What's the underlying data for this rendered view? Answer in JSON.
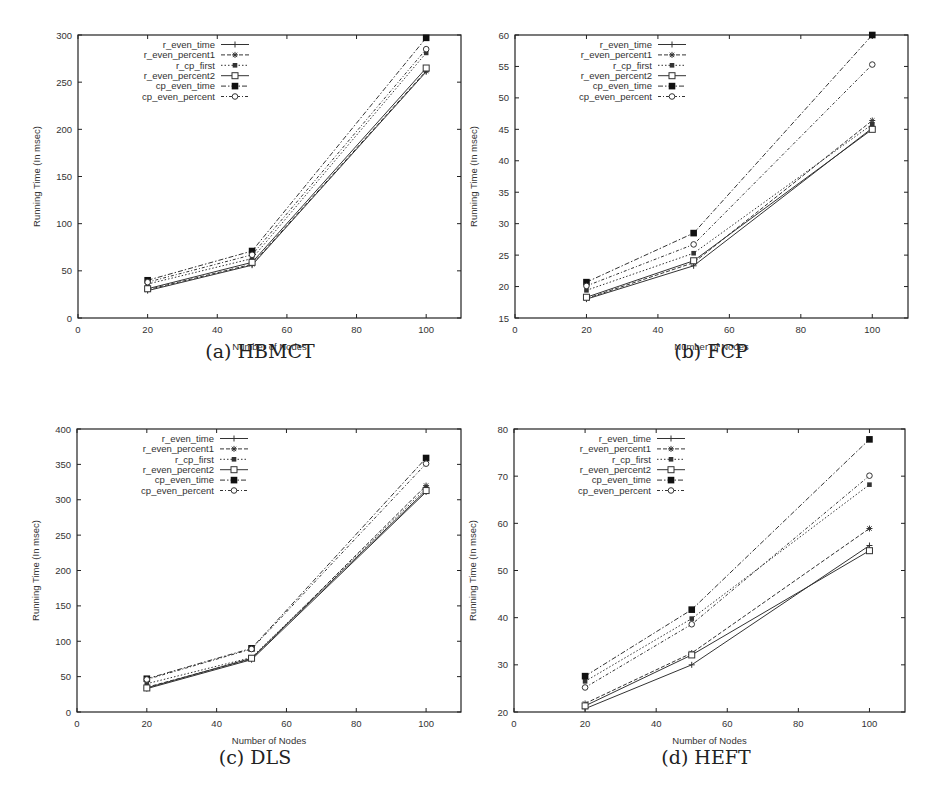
{
  "figure": {
    "series_names": [
      "r_even_time",
      "r_even_percent1",
      "r_cp_first",
      "r_even_percent2",
      "cp_even_time",
      "cp_even_percent"
    ],
    "xlabel": "Number of Nodes",
    "ylabel": "Running Time (In msec)"
  },
  "chart_data": [
    {
      "id": "a",
      "type": "line",
      "title": "(a) HBMCT",
      "xlabel": "Number of Nodes",
      "ylabel": "Running Time (In msec)",
      "x": [
        20,
        50,
        100
      ],
      "xlim": [
        0,
        110
      ],
      "ylim": [
        0,
        300
      ],
      "xticks": [
        0,
        20,
        40,
        60,
        80,
        100
      ],
      "yticks": [
        0,
        50,
        100,
        150,
        200,
        250,
        300
      ],
      "grid": false,
      "legend_position": "upper left",
      "series": [
        {
          "name": "r_even_time",
          "values": [
            29,
            56,
            261
          ]
        },
        {
          "name": "r_even_percent1",
          "values": [
            30,
            57,
            262
          ]
        },
        {
          "name": "r_cp_first",
          "values": [
            36,
            63,
            281
          ]
        },
        {
          "name": "r_even_percent2",
          "values": [
            31,
            59,
            265
          ]
        },
        {
          "name": "cp_even_time",
          "values": [
            40,
            71,
            297
          ]
        },
        {
          "name": "cp_even_percent",
          "values": [
            38,
            67,
            285
          ]
        }
      ]
    },
    {
      "id": "b",
      "type": "line",
      "title": "(b) FCP",
      "xlabel": "Number of Nodes",
      "ylabel": "Running Time (In msec)",
      "x": [
        20,
        50,
        100
      ],
      "xlim": [
        0,
        110
      ],
      "ylim": [
        15,
        60
      ],
      "xticks": [
        0,
        20,
        40,
        60,
        80,
        100
      ],
      "yticks": [
        15,
        20,
        25,
        30,
        35,
        40,
        45,
        50,
        55,
        60
      ],
      "grid": false,
      "legend_position": "upper left",
      "series": [
        {
          "name": "r_even_time",
          "values": [
            18.0,
            23.3,
            45.2
          ]
        },
        {
          "name": "r_even_percent1",
          "values": [
            18.1,
            23.8,
            46.4
          ]
        },
        {
          "name": "r_cp_first",
          "values": [
            19.4,
            25.3,
            45.8
          ]
        },
        {
          "name": "r_even_percent2",
          "values": [
            18.3,
            24.1,
            45.0
          ]
        },
        {
          "name": "cp_even_time",
          "values": [
            20.7,
            28.5,
            60.0
          ]
        },
        {
          "name": "cp_even_percent",
          "values": [
            20.1,
            26.7,
            55.3
          ]
        }
      ]
    },
    {
      "id": "c",
      "type": "line",
      "title": "(c) DLS",
      "xlabel": "Number of Nodes",
      "ylabel": "Running Time (In msec)",
      "x": [
        20,
        50,
        100
      ],
      "xlim": [
        0,
        110
      ],
      "ylim": [
        0,
        400
      ],
      "xticks": [
        0,
        20,
        40,
        60,
        80,
        100
      ],
      "yticks": [
        0,
        50,
        100,
        150,
        200,
        250,
        300,
        350,
        400
      ],
      "grid": false,
      "legend_position": "upper left",
      "series": [
        {
          "name": "r_even_time",
          "values": [
            33,
            74,
            311
          ]
        },
        {
          "name": "r_even_percent1",
          "values": [
            35,
            75,
            320
          ]
        },
        {
          "name": "r_cp_first",
          "values": [
            40,
            77,
            316
          ]
        },
        {
          "name": "r_even_percent2",
          "values": [
            34,
            76,
            313
          ]
        },
        {
          "name": "cp_even_time",
          "values": [
            47,
            90,
            359
          ]
        },
        {
          "name": "cp_even_percent",
          "values": [
            46,
            89,
            351
          ]
        }
      ]
    },
    {
      "id": "d",
      "type": "line",
      "title": "(d) HEFT",
      "xlabel": "Number of Nodes",
      "ylabel": "Running Time (In msec)",
      "x": [
        20,
        50,
        100
      ],
      "xlim": [
        0,
        110
      ],
      "ylim": [
        20,
        80
      ],
      "xticks": [
        0,
        20,
        40,
        60,
        80,
        100
      ],
      "yticks": [
        20,
        30,
        40,
        50,
        60,
        70,
        80
      ],
      "grid": false,
      "legend_position": "upper left",
      "series": [
        {
          "name": "r_even_time",
          "values": [
            20.7,
            30.0,
            55.3
          ]
        },
        {
          "name": "r_even_percent1",
          "values": [
            21.8,
            32.5,
            58.9
          ]
        },
        {
          "name": "r_cp_first",
          "values": [
            26.5,
            39.8,
            68.2
          ]
        },
        {
          "name": "r_even_percent2",
          "values": [
            21.3,
            32.1,
            54.2
          ]
        },
        {
          "name": "cp_even_time",
          "values": [
            27.6,
            41.7,
            77.8
          ]
        },
        {
          "name": "cp_even_percent",
          "values": [
            25.2,
            38.6,
            70.1
          ]
        }
      ]
    }
  ],
  "styles": {
    "line_color": "#333333",
    "axis_color": "#222222",
    "series": [
      {
        "dash": "",
        "marker": "plus"
      },
      {
        "dash": "4,2",
        "marker": "star"
      },
      {
        "dash": "1.5,2",
        "marker": "filled-square-small"
      },
      {
        "dash": "",
        "marker": "open-square"
      },
      {
        "dash": "5,2,1.5,2",
        "marker": "filled-square"
      },
      {
        "dash": "3,2,1,2",
        "marker": "open-circle"
      }
    ]
  }
}
